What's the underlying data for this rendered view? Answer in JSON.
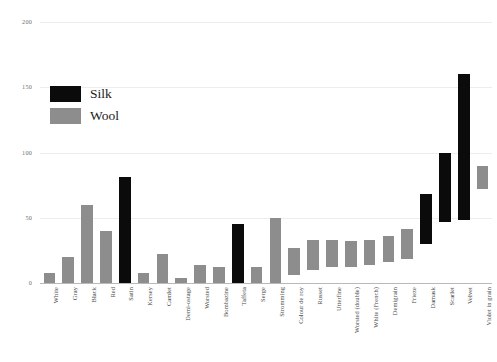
{
  "chart_data": {
    "type": "bar",
    "title": "",
    "subtitle": "",
    "xlabel": "",
    "ylabel": "",
    "ylim": [
      0,
      200
    ],
    "yticks": [
      0,
      50,
      100,
      150,
      200
    ],
    "ytick_labels": [
      "0",
      "50",
      "100",
      "150",
      "200"
    ],
    "grid": true,
    "orientation": "vertical",
    "bar_style": "range",
    "legend": {
      "position": "upper-left",
      "entries": [
        {
          "name": "Silk",
          "color": "#0b0b0b"
        },
        {
          "name": "Wool",
          "color": "#8d8d8d"
        }
      ]
    },
    "categories": [
      "White",
      "Gray",
      "Black",
      "Red",
      "Satin",
      "Kersey",
      "Camlet",
      "Demi-ostage",
      "Worsted",
      "Bombazine",
      "Taffeta",
      "Serge",
      "Stromming",
      "Colour de roy",
      "Russet",
      "Utterfine",
      "Worsted (double)",
      "White (French)",
      "Demigrain",
      "Frieze",
      "Damask",
      "Scarlet",
      "Velvet",
      "Violet in grain"
    ],
    "series_name_field": "material",
    "bars": [
      {
        "category": "White",
        "material": "Wool",
        "low": 0,
        "high": 8,
        "color": "#8d8d8d"
      },
      {
        "category": "Gray",
        "material": "Wool",
        "low": 0,
        "high": 20,
        "color": "#8d8d8d"
      },
      {
        "category": "Black",
        "material": "Wool",
        "low": 0,
        "high": 60,
        "color": "#8d8d8d"
      },
      {
        "category": "Red",
        "material": "Wool",
        "low": 0,
        "high": 40,
        "color": "#8d8d8d"
      },
      {
        "category": "Satin",
        "material": "Silk",
        "low": 0,
        "high": 81,
        "color": "#0b0b0b"
      },
      {
        "category": "Kersey",
        "material": "Wool",
        "low": 0,
        "high": 8,
        "color": "#8d8d8d"
      },
      {
        "category": "Camlet",
        "material": "Wool",
        "low": 0,
        "high": 22,
        "color": "#8d8d8d"
      },
      {
        "category": "Demi-ostage",
        "material": "Wool",
        "low": 0,
        "high": 4,
        "color": "#8d8d8d"
      },
      {
        "category": "Worsted",
        "material": "Wool",
        "low": 0,
        "high": 14,
        "color": "#8d8d8d"
      },
      {
        "category": "Bombazine",
        "material": "Wool",
        "low": 0,
        "high": 12,
        "color": "#8d8d8d"
      },
      {
        "category": "Taffeta",
        "material": "Silk",
        "low": 0,
        "high": 45,
        "color": "#0b0b0b"
      },
      {
        "category": "Serge",
        "material": "Wool",
        "low": 0,
        "high": 12,
        "color": "#8d8d8d"
      },
      {
        "category": "Stromming",
        "material": "Wool",
        "low": 0,
        "high": 50,
        "color": "#8d8d8d"
      },
      {
        "category": "Colour de roy",
        "material": "Wool",
        "low": 6,
        "high": 27,
        "color": "#8d8d8d"
      },
      {
        "category": "Russet",
        "material": "Wool",
        "low": 10,
        "high": 33,
        "color": "#8d8d8d"
      },
      {
        "category": "Utterfine",
        "material": "Wool",
        "low": 12,
        "high": 33,
        "color": "#8d8d8d"
      },
      {
        "category": "Worsted (double)",
        "material": "Wool",
        "low": 12,
        "high": 32,
        "color": "#8d8d8d"
      },
      {
        "category": "White (French)",
        "material": "Wool",
        "low": 14,
        "high": 33,
        "color": "#8d8d8d"
      },
      {
        "category": "Demigrain",
        "material": "Wool",
        "low": 16,
        "high": 36,
        "color": "#8d8d8d"
      },
      {
        "category": "Frieze",
        "material": "Wool",
        "low": 18,
        "high": 41,
        "color": "#8d8d8d"
      },
      {
        "category": "Damask",
        "material": "Silk",
        "low": 30,
        "high": 68,
        "color": "#0b0b0b"
      },
      {
        "category": "Scarlet",
        "material": "Silk",
        "low": 47,
        "high": 100,
        "color": "#0b0b0b"
      },
      {
        "category": "Velvet",
        "material": "Silk",
        "low": 48,
        "high": 160,
        "color": "#0b0b0b"
      },
      {
        "category": "Violet in grain",
        "material": "Wool",
        "low": 72,
        "high": 90,
        "color": "#8d8d8d"
      }
    ]
  }
}
